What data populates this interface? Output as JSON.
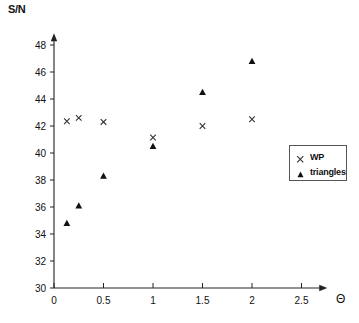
{
  "chart_data": {
    "type": "scatter",
    "title": "",
    "xlabel": "Θ",
    "ylabel": "S/N",
    "xlim": [
      0,
      2.75
    ],
    "ylim": [
      30,
      48.8
    ],
    "xticks": [
      "0",
      "0.5",
      "1",
      "1.5",
      "2",
      "2.5"
    ],
    "xtick_values": [
      0,
      0.5,
      1,
      1.5,
      2,
      2.5
    ],
    "yticks": [
      "30",
      "32",
      "34",
      "36",
      "38",
      "40",
      "42",
      "44",
      "46",
      "48"
    ],
    "ytick_values": [
      30,
      32,
      34,
      36,
      38,
      40,
      42,
      44,
      46,
      48
    ],
    "grid": false,
    "legend_position": "right-middle",
    "series": [
      {
        "name": "WP",
        "marker": "x",
        "color": "#333333",
        "points": [
          {
            "x": 0.13,
            "y": 42.35
          },
          {
            "x": 0.25,
            "y": 42.6
          },
          {
            "x": 0.5,
            "y": 42.3
          },
          {
            "x": 1.0,
            "y": 41.15
          },
          {
            "x": 1.5,
            "y": 42.0
          },
          {
            "x": 2.0,
            "y": 42.5
          }
        ]
      },
      {
        "name": "triangles",
        "marker": "triangle",
        "color": "#111111",
        "points": [
          {
            "x": 0.13,
            "y": 34.8
          },
          {
            "x": 0.25,
            "y": 36.1
          },
          {
            "x": 0.5,
            "y": 38.3
          },
          {
            "x": 1.0,
            "y": 40.5
          },
          {
            "x": 1.5,
            "y": 44.5
          },
          {
            "x": 2.0,
            "y": 46.8
          }
        ]
      }
    ]
  },
  "legend": {
    "entries": [
      {
        "label": "WP",
        "marker": "x"
      },
      {
        "label": "triangles",
        "marker": "triangle"
      }
    ]
  },
  "axes": {
    "y_title": "S/N",
    "x_title": "Θ"
  }
}
